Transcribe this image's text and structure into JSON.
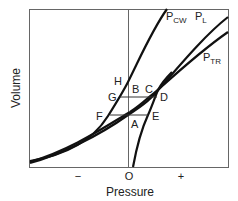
{
  "diagram": {
    "axes": {
      "xlabel": "Pressure",
      "ylabel": "Volume",
      "xticks": [
        "−",
        "O",
        "+"
      ]
    },
    "curves": [
      {
        "id": "pcw",
        "label_main": "P",
        "label_sub": "CW"
      },
      {
        "id": "pl",
        "label_main": "P",
        "label_sub": "L"
      },
      {
        "id": "ptr",
        "label_main": "P",
        "label_sub": "TR"
      }
    ],
    "points": {
      "H": "H",
      "B": "B",
      "C": "C",
      "G": "G",
      "D": "D",
      "F": "F",
      "A": "A",
      "E": "E"
    },
    "colors": {
      "line": "#111111",
      "frame": "#555555",
      "text": "#222222"
    }
  }
}
